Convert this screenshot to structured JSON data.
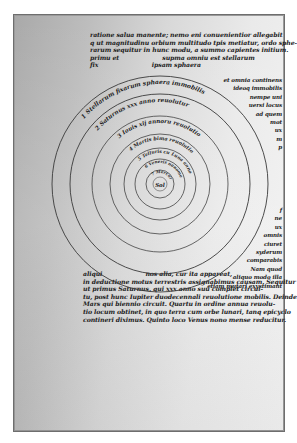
{
  "document": {
    "type": "manuscript-page",
    "subject": "heliocentric diagram of concentric planetary spheres",
    "top_text_lines": [
      "ratione salua manente; nemo eni conuenientior allegabit",
      "q ut magnitudinu orbium multitudo tpis metiatur, ordo sphe-",
      "rarum sequitur in hunc modu, a summo capientes initium.",
      "primu et                     supma omniu est stellarum",
      "fix                          ipsam sphaera"
    ],
    "right_margin_lines": [
      "et omnia continens",
      "ideoq immobilis",
      "nempe uni",
      "uersi locus",
      "ad quem",
      "mot",
      "ux",
      "m",
      "p"
    ],
    "right_margin_lower_lines": [
      "f",
      "ne",
      "ux",
      "omnis",
      "ciuret",
      "syderum",
      "comparabis",
      "Nam quod",
      "aliquo modo illa",
      "etiam mutari exystimant"
    ],
    "bottom_text_lines": [
      "aliqui                     nos alia, cur ita appareat,",
      "in deductione motus terrestris assignabimus causam. Sequitur",
      "ut primus Saturnus, qui xxx anno suu complet circui-",
      "tu, post hunc Iupiter duodecennali reuolutione mobilis. Deinde",
      "Mars qui biennio circuit. Quartu in ordine annua reuolu-",
      "tio locum obtinet, in quo terra cum orbe lunari, tanq epicyclo",
      "contineri diximus. Quinto loco Venus nono mense reducitur."
    ],
    "spheres": [
      {
        "number": "1",
        "label": "Stellarum fixarum sphaera immobilis"
      },
      {
        "number": "2",
        "label": "Saturnus xxx anno reuolutur"
      },
      {
        "number": "3",
        "label": "Iouis xij annoru reuolutio"
      },
      {
        "number": "4",
        "label": "Martis bima reuolutio"
      },
      {
        "number": "5",
        "label": "Telluris cu Luna anno reuolutio"
      },
      {
        "number": "6",
        "label": "Veneris nonomensis"
      },
      {
        "number": "7",
        "label": "Mercurii lxxx dierum"
      }
    ],
    "center_label": "Sol",
    "colors": {
      "ink": "#1c1c1c",
      "circle_stroke": "#3a3a3a",
      "page_dark": "#a9a9a9",
      "page_light": "#f3f3f3",
      "frame": "#6e6e6e"
    }
  }
}
